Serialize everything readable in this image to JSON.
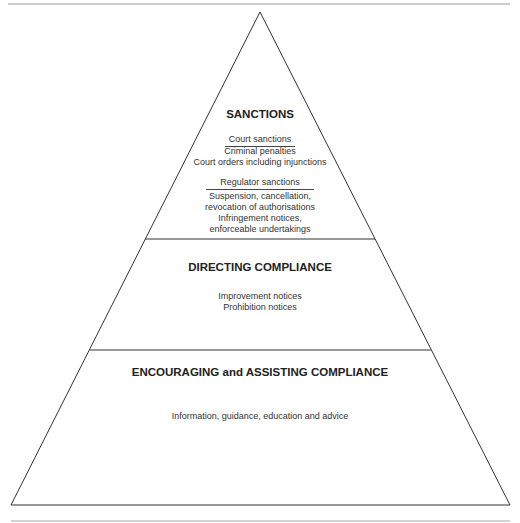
{
  "pyramid": {
    "tiers": [
      {
        "heading": "SANCTIONS",
        "groups": [
          {
            "title": "Court sanctions",
            "items": [
              "Criminal penalties",
              "Court orders including injunctions"
            ]
          },
          {
            "title": "Regulator sanctions",
            "items": [
              "Suspension, cancellation,",
              "revocation of authorisations",
              "Infringement notices,",
              "enforceable undertakings"
            ]
          }
        ]
      },
      {
        "heading": "DIRECTING COMPLIANCE",
        "items": [
          "Improvement notices",
          "Prohibition notices"
        ]
      },
      {
        "heading": "ENCOURAGING and ASSISTING COMPLIANCE",
        "items": [
          "Information, guidance, education and advice"
        ]
      }
    ]
  },
  "colors": {
    "line": "#333333",
    "rule": "#999999",
    "background": "#ffffff"
  }
}
